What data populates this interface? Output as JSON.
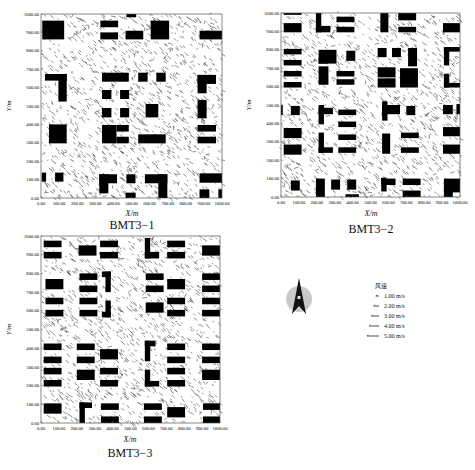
{
  "figure": {
    "panels": [
      {
        "id": "BMT3-1",
        "caption": "BMT3−1",
        "xlabel": "X/m",
        "ylabel": "Y/m"
      },
      {
        "id": "BMT3-2",
        "caption": "BMT3−2",
        "xlabel": "X/m",
        "ylabel": "Y/m"
      },
      {
        "id": "BMT3-3",
        "caption": "BMT3−3",
        "xlabel": "X/m",
        "ylabel": "Y/m"
      }
    ],
    "x_ticks": [
      "0.00",
      "100.00",
      "200.00",
      "300.00",
      "400.00",
      "500.00",
      "600.00",
      "700.00",
      "800.00",
      "900.00",
      "1000.00"
    ],
    "y_ticks": [
      "0.00",
      "100.00",
      "200.00",
      "300.00",
      "400.00",
      "500.00",
      "600.00",
      "700.00",
      "800.00",
      "900.00",
      "1000.00"
    ],
    "legend": {
      "title": "风速",
      "items": [
        {
          "label": "1.00 m/s",
          "len": 1
        },
        {
          "label": "2.00 m/s",
          "len": 2
        },
        {
          "label": "3.00 m/s",
          "len": 3
        },
        {
          "label": "4.00 m/s",
          "len": 4
        },
        {
          "label": "5.00 m/s",
          "len": 5
        }
      ]
    },
    "compass": {
      "label": "N-arrow",
      "circle_color": "#c8c8c8",
      "arrow_color": "#111111"
    }
  },
  "chart_data": [
    {
      "type": "vector_field",
      "title": "BMT3-1",
      "xlabel": "X/m",
      "ylabel": "Y/m",
      "xlim": [
        0,
        1000
      ],
      "ylim": [
        0,
        1000
      ],
      "x_ticks": [
        0,
        100,
        200,
        300,
        400,
        500,
        600,
        700,
        800,
        900,
        1000
      ],
      "y_ticks": [
        0,
        100,
        200,
        300,
        400,
        500,
        600,
        700,
        800,
        900,
        1000
      ],
      "prevailing_wind": "from north-west toward south-east",
      "buildings": [
        [
          7,
          862,
          121,
          102
        ],
        [
          328,
          928,
          98,
          36
        ],
        [
          328,
          862,
          98,
          38
        ],
        [
          472,
          982,
          54,
          18
        ],
        [
          467,
          862,
          98,
          47
        ],
        [
          606,
          862,
          102,
          102
        ],
        [
          876,
          862,
          124,
          47
        ],
        [
          22,
          638,
          120,
          36
        ],
        [
          96,
          524,
          46,
          150
        ],
        [
          337,
          632,
          148,
          49
        ],
        [
          537,
          632,
          52,
          49
        ],
        [
          637,
          632,
          52,
          49
        ],
        [
          337,
          538,
          52,
          49
        ],
        [
          437,
          538,
          50,
          49
        ],
        [
          337,
          438,
          52,
          51
        ],
        [
          437,
          438,
          50,
          51
        ],
        [
          578,
          438,
          70,
          73
        ],
        [
          865,
          620,
          102,
          49
        ],
        [
          865,
          569,
          50,
          100
        ],
        [
          865,
          433,
          50,
          100
        ],
        [
          44,
          297,
          98,
          103
        ],
        [
          337,
          297,
          80,
          100
        ],
        [
          417,
          361,
          68,
          36
        ],
        [
          417,
          297,
          68,
          36
        ],
        [
          537,
          297,
          152,
          49
        ],
        [
          865,
          361,
          102,
          36
        ],
        [
          865,
          297,
          102,
          36
        ],
        [
          4,
          89,
          24,
          49
        ],
        [
          78,
          89,
          46,
          49
        ],
        [
          322,
          80,
          98,
          49
        ],
        [
          322,
          25,
          50,
          104
        ],
        [
          472,
          80,
          50,
          49
        ],
        [
          467,
          0,
          56,
          29
        ],
        [
          574,
          80,
          124,
          49
        ],
        [
          648,
          0,
          50,
          129
        ],
        [
          876,
          83,
          124,
          51
        ],
        [
          876,
          0,
          54,
          47
        ],
        [
          980,
          0,
          20,
          47
        ]
      ]
    },
    {
      "type": "vector_field",
      "title": "BMT3-2",
      "xlabel": "X/m",
      "ylabel": "Y/m",
      "xlim": [
        0,
        1000
      ],
      "ylim": [
        0,
        1000
      ],
      "x_ticks": [
        0,
        100,
        200,
        300,
        400,
        500,
        600,
        700,
        800,
        900,
        1000
      ],
      "y_ticks": [
        0,
        100,
        200,
        300,
        400,
        500,
        600,
        700,
        800,
        900,
        1000
      ],
      "prevailing_wind": "from north-west toward south-east",
      "buildings": [
        [
          15,
          990,
          100,
          10
        ],
        [
          15,
          895,
          100,
          50
        ],
        [
          195,
          895,
          30,
          105
        ],
        [
          195,
          895,
          80,
          35
        ],
        [
          310,
          950,
          100,
          30
        ],
        [
          310,
          895,
          100,
          30
        ],
        [
          555,
          895,
          45,
          105
        ],
        [
          655,
          960,
          100,
          40
        ],
        [
          655,
          895,
          100,
          30
        ],
        [
          905,
          895,
          95,
          50
        ],
        [
          15,
          775,
          100,
          30
        ],
        [
          15,
          715,
          100,
          30
        ],
        [
          15,
          655,
          100,
          30
        ],
        [
          15,
          595,
          100,
          30
        ],
        [
          210,
          725,
          100,
          75
        ],
        [
          210,
          725,
          50,
          30
        ],
        [
          210,
          610,
          55,
          100
        ],
        [
          310,
          610,
          100,
          30
        ],
        [
          310,
          655,
          100,
          30
        ],
        [
          365,
          740,
          50,
          55
        ],
        [
          540,
          760,
          50,
          50
        ],
        [
          620,
          760,
          50,
          50
        ],
        [
          710,
          710,
          50,
          100
        ],
        [
          540,
          650,
          100,
          55
        ],
        [
          540,
          595,
          100,
          50
        ],
        [
          665,
          595,
          100,
          105
        ],
        [
          910,
          790,
          90,
          25
        ],
        [
          910,
          715,
          30,
          100
        ],
        [
          910,
          595,
          30,
          75
        ],
        [
          910,
          595,
          90,
          25
        ],
        [
          0,
          445,
          10,
          55
        ],
        [
          55,
          445,
          50,
          50
        ],
        [
          15,
          320,
          100,
          55
        ],
        [
          15,
          230,
          100,
          55
        ],
        [
          210,
          395,
          30,
          105
        ],
        [
          210,
          450,
          80,
          35
        ],
        [
          320,
          445,
          100,
          30
        ],
        [
          320,
          380,
          100,
          30
        ],
        [
          320,
          310,
          100,
          30
        ],
        [
          320,
          240,
          100,
          30
        ],
        [
          210,
          240,
          30,
          110
        ],
        [
          210,
          240,
          80,
          30
        ],
        [
          565,
          415,
          30,
          105
        ],
        [
          565,
          450,
          100,
          50
        ],
        [
          700,
          445,
          50,
          50
        ],
        [
          565,
          235,
          45,
          110
        ],
        [
          670,
          320,
          100,
          30
        ],
        [
          670,
          240,
          100,
          30
        ],
        [
          905,
          450,
          55,
          50
        ],
        [
          980,
          450,
          20,
          55
        ],
        [
          905,
          330,
          95,
          50
        ],
        [
          905,
          235,
          95,
          50
        ],
        [
          55,
          35,
          50,
          55
        ],
        [
          195,
          0,
          50,
          100
        ],
        [
          280,
          40,
          50,
          55
        ],
        [
          370,
          40,
          50,
          55
        ],
        [
          360,
          0,
          75,
          15
        ],
        [
          560,
          30,
          30,
          75
        ],
        [
          560,
          65,
          80,
          35
        ],
        [
          680,
          65,
          100,
          35
        ],
        [
          680,
          0,
          100,
          35
        ],
        [
          910,
          25,
          90,
          75
        ],
        [
          910,
          0,
          50,
          40
        ]
      ]
    },
    {
      "type": "vector_field",
      "title": "BMT3-3",
      "xlabel": "X/m",
      "ylabel": "Y/m",
      "xlim": [
        0,
        1000
      ],
      "ylim": [
        0,
        1000
      ],
      "x_ticks": [
        0,
        100,
        200,
        300,
        400,
        500,
        600,
        700,
        800,
        900,
        1000
      ],
      "y_ticks": [
        0,
        100,
        200,
        300,
        400,
        500,
        600,
        700,
        800,
        900,
        1000
      ],
      "prevailing_wind": "from north-west toward south-east",
      "buildings": [
        [
          15,
          940,
          100,
          35
        ],
        [
          15,
          880,
          100,
          35
        ],
        [
          210,
          895,
          100,
          55
        ],
        [
          330,
          940,
          100,
          35
        ],
        [
          330,
          880,
          100,
          35
        ],
        [
          580,
          880,
          30,
          110
        ],
        [
          580,
          880,
          80,
          35
        ],
        [
          705,
          940,
          100,
          35
        ],
        [
          705,
          880,
          100,
          35
        ],
        [
          900,
          895,
          100,
          55
        ],
        [
          25,
          715,
          100,
          55
        ],
        [
          215,
          765,
          100,
          35
        ],
        [
          215,
          700,
          100,
          35
        ],
        [
          215,
          635,
          100,
          35
        ],
        [
          215,
          570,
          100,
          35
        ],
        [
          360,
          700,
          30,
          110
        ],
        [
          340,
          780,
          50,
          30
        ],
        [
          340,
          565,
          50,
          30
        ],
        [
          360,
          565,
          30,
          90
        ],
        [
          25,
          635,
          100,
          35
        ],
        [
          25,
          570,
          100,
          35
        ],
        [
          585,
          765,
          100,
          35
        ],
        [
          585,
          700,
          100,
          35
        ],
        [
          585,
          590,
          100,
          55
        ],
        [
          705,
          715,
          100,
          55
        ],
        [
          705,
          635,
          100,
          35
        ],
        [
          705,
          570,
          100,
          35
        ],
        [
          900,
          765,
          100,
          35
        ],
        [
          900,
          700,
          100,
          35
        ],
        [
          900,
          635,
          100,
          35
        ],
        [
          900,
          570,
          100,
          35
        ],
        [
          15,
          390,
          100,
          35
        ],
        [
          15,
          320,
          100,
          35
        ],
        [
          15,
          260,
          100,
          35
        ],
        [
          15,
          195,
          100,
          35
        ],
        [
          200,
          390,
          100,
          35
        ],
        [
          200,
          320,
          100,
          35
        ],
        [
          200,
          230,
          100,
          55
        ],
        [
          330,
          340,
          100,
          55
        ],
        [
          330,
          260,
          100,
          35
        ],
        [
          330,
          195,
          100,
          35
        ],
        [
          580,
          330,
          30,
          110
        ],
        [
          580,
          410,
          60,
          30
        ],
        [
          580,
          195,
          30,
          90
        ],
        [
          580,
          195,
          80,
          30
        ],
        [
          705,
          390,
          100,
          35
        ],
        [
          705,
          320,
          100,
          35
        ],
        [
          705,
          260,
          100,
          35
        ],
        [
          705,
          195,
          100,
          35
        ],
        [
          900,
          390,
          100,
          35
        ],
        [
          900,
          320,
          100,
          35
        ],
        [
          900,
          230,
          100,
          55
        ],
        [
          15,
          50,
          100,
          55
        ],
        [
          215,
          0,
          30,
          110
        ],
        [
          215,
          80,
          70,
          30
        ],
        [
          335,
          70,
          100,
          35
        ],
        [
          335,
          0,
          100,
          35
        ],
        [
          575,
          70,
          100,
          35
        ],
        [
          575,
          0,
          100,
          35
        ],
        [
          705,
          30,
          100,
          55
        ],
        [
          905,
          70,
          95,
          35
        ],
        [
          905,
          0,
          95,
          35
        ]
      ]
    }
  ]
}
